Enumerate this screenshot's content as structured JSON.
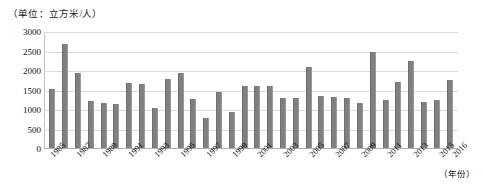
{
  "chart_data": {
    "type": "bar",
    "title": "（单位：立方米/人）",
    "unit_caption": "（单位：立方米/人）",
    "xlabel": "（年份）",
    "ylabel": "",
    "ylim": [
      0,
      3000
    ],
    "ytick_values": [
      0,
      500,
      1000,
      1500,
      2000,
      2500,
      3000
    ],
    "ytick_labels": [
      "0",
      "500",
      "1000",
      "1500",
      "2000",
      "2500",
      "3000"
    ],
    "grid": true,
    "legend": null,
    "bar_color": "#808080",
    "gridline_color": "#d9d9d9",
    "xtick_label_rotation": -45,
    "xtick_label_interval": 2,
    "categories": [
      "1985",
      "1986",
      "1987",
      "1988",
      "1989",
      "1990",
      "1991",
      "1992",
      "1993",
      "1994",
      "1995",
      "1996",
      "1997",
      "1998",
      "1999",
      "2000",
      "2001",
      "2002",
      "2003",
      "2004",
      "2005",
      "2006",
      "2007",
      "2008",
      "2009",
      "2010",
      "2011",
      "2012",
      "2013",
      "2014",
      "2015",
      "2016"
    ],
    "visible_xtick_labels": [
      "1985",
      "1987",
      "1989",
      "1991",
      "1993",
      "1995",
      "1997",
      "1999",
      "2001",
      "2003",
      "2005",
      "2007",
      "2009",
      "2011",
      "2013",
      "2015",
      "2016"
    ],
    "values": [
      1550,
      2700,
      1950,
      1220,
      1190,
      1160,
      1680,
      1660,
      1050,
      1800,
      1950,
      1270,
      800,
      1450,
      950,
      1620,
      1620,
      1620,
      1320,
      1300,
      2100,
      1350,
      1340,
      1300,
      1190,
      2500,
      1250,
      1730,
      2250,
      1200,
      1250,
      1770
    ]
  }
}
